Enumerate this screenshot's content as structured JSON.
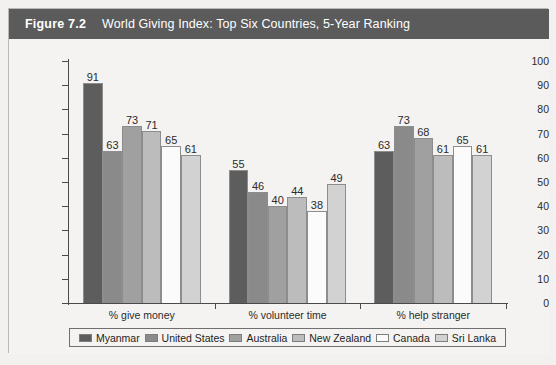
{
  "header": {
    "figure_number": "Figure 7.2",
    "title": "World Giving Index: Top Six Countries, 5-Year Ranking"
  },
  "chart_data": {
    "type": "bar",
    "title": "World Giving Index: Top Six Countries, 5-Year Ranking",
    "xlabel": "",
    "ylabel": "",
    "ylim": [
      0,
      100
    ],
    "ytick_step": 10,
    "yticks": [
      100,
      90,
      80,
      70,
      60,
      50,
      40,
      30,
      20,
      10,
      0
    ],
    "grid": false,
    "legend_position": "bottom",
    "categories": [
      "% give money",
      "% volunteer time",
      "% help stranger"
    ],
    "series": [
      {
        "name": "Myanmar",
        "color": "#5d5d5d",
        "values": [
          91,
          55,
          63
        ]
      },
      {
        "name": "United States",
        "color": "#8a8a8a",
        "values": [
          63,
          46,
          73
        ]
      },
      {
        "name": "Australia",
        "color": "#a0a0a0",
        "values": [
          73,
          40,
          68
        ]
      },
      {
        "name": "New Zealand",
        "color": "#bcbcbc",
        "values": [
          71,
          44,
          61
        ]
      },
      {
        "name": "Canada",
        "color": "#fbfbfb",
        "values": [
          65,
          38,
          65
        ]
      },
      {
        "name": "Sri Lanka",
        "color": "#d2d2d2",
        "values": [
          61,
          49,
          61
        ]
      }
    ]
  }
}
